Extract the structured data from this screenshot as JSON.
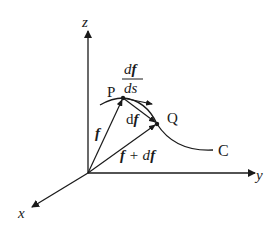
{
  "diagram": {
    "type": "vector-calculus-space-curve",
    "axes": {
      "x": {
        "label": "x"
      },
      "y": {
        "label": "y"
      },
      "z": {
        "label": "z"
      }
    },
    "points": {
      "P": {
        "label": "P"
      },
      "Q": {
        "label": "Q"
      }
    },
    "curve": {
      "label": "C"
    },
    "vectors": {
      "f": {
        "label": "f"
      },
      "df": {
        "label_prefix": "d",
        "label_vec": "f"
      },
      "f_plus_df": {
        "label_a": "f",
        "label_op": " + d",
        "label_b": "f"
      }
    },
    "tangent": {
      "numerator_prefix": "d",
      "numerator_vec": "f",
      "denominator": "ds"
    },
    "colors": {
      "stroke": "#1a1a1a",
      "background": "#ffffff"
    }
  }
}
